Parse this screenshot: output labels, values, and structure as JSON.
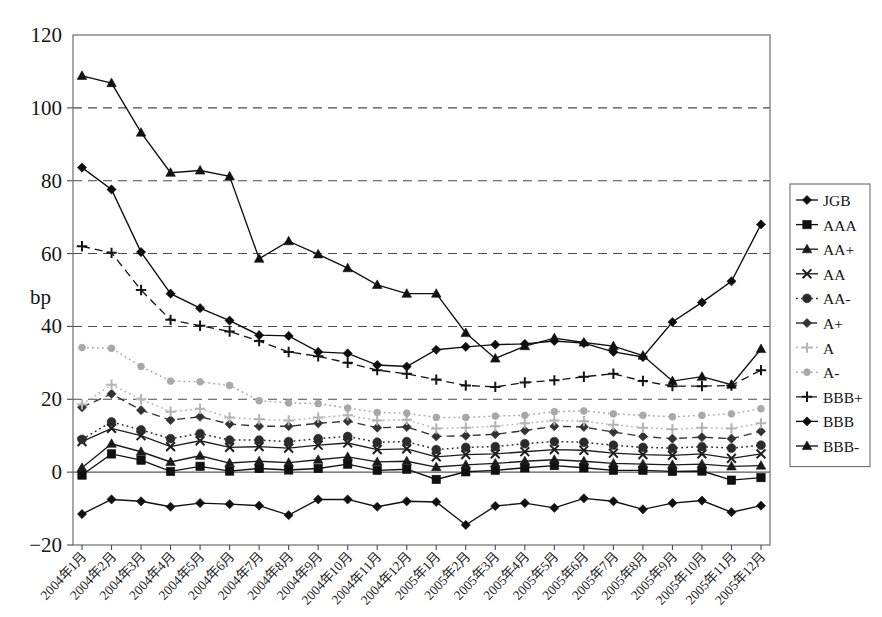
{
  "chart": {
    "title": "",
    "ylabel": "bp",
    "xlabel": "",
    "ylim": [
      -20,
      120
    ],
    "ytick_labels": [
      "120",
      "100",
      "80",
      "60",
      "40",
      "20",
      "0",
      "-20"
    ],
    "ytick_values": [
      120,
      100,
      80,
      60,
      40,
      20,
      0,
      -20
    ],
    "grid": "horizontal-dashed",
    "legend_position": "right-outside"
  },
  "chart_data": {
    "type": "line",
    "title": "",
    "xlabel": "",
    "ylabel": "bp",
    "ylim": [
      -20,
      120
    ],
    "yticks": [
      -20,
      0,
      20,
      40,
      60,
      80,
      100,
      120
    ],
    "grid": true,
    "legend": "right",
    "categories": [
      "2004年1月",
      "2004年2月",
      "2004年3月",
      "2004年4月",
      "2004年5月",
      "2004年6月",
      "2004年7月",
      "2004年8月",
      "2004年9月",
      "2004年10月",
      "2004年11月",
      "2004年12月",
      "2005年1月",
      "2005年2月",
      "2005年3月",
      "2005年4月",
      "2005年5月",
      "2005年6月",
      "2005年7月",
      "2005年8月",
      "2005年9月",
      "2005年10月",
      "2005年11月",
      "2005年12月"
    ],
    "series": [
      {
        "name": "JGB",
        "marker": "diamond",
        "linestyle": "solid",
        "color": "#101010",
        "values": [
          -11.5,
          -7.5,
          -8.0,
          -9.5,
          -8.5,
          -8.8,
          -9.2,
          -11.8,
          -7.5,
          -7.5,
          -9.5,
          -8.0,
          -8.2,
          -14.5,
          -9.3,
          -8.5,
          -9.8,
          -7.2,
          -8.0,
          -10.2,
          -8.5,
          -7.8,
          -11.0,
          -9.2
        ]
      },
      {
        "name": "AAA",
        "marker": "square",
        "linestyle": "solid",
        "color": "#101010",
        "values": [
          -0.8,
          5.0,
          3.3,
          0.2,
          1.6,
          0.3,
          1.0,
          0.6,
          1.0,
          2.2,
          0.5,
          0.8,
          -2.0,
          0.1,
          0.5,
          1.2,
          1.8,
          1.2,
          0.5,
          0.5,
          0.2,
          0.3,
          -2.2,
          -1.5
        ]
      },
      {
        "name": "AA+",
        "marker": "triangle",
        "linestyle": "solid",
        "color": "#1a1a1a",
        "values": [
          1.2,
          7.8,
          5.6,
          2.8,
          4.5,
          2.5,
          3.0,
          2.6,
          3.4,
          4.2,
          2.8,
          3.0,
          1.4,
          2.0,
          2.4,
          3.0,
          3.4,
          3.0,
          2.4,
          2.2,
          2.0,
          2.2,
          1.6,
          1.8
        ]
      },
      {
        "name": "AA",
        "marker": "x",
        "linestyle": "solid",
        "color": "#1d1d1d",
        "values": [
          8.4,
          12.0,
          10.0,
          7.0,
          8.6,
          6.8,
          7.0,
          6.6,
          7.4,
          8.0,
          6.2,
          6.4,
          4.2,
          4.8,
          5.0,
          5.6,
          6.2,
          6.0,
          5.2,
          4.8,
          4.6,
          5.0,
          3.8,
          5.0
        ]
      },
      {
        "name": "AA-",
        "marker": "circle",
        "linestyle": "dotted",
        "color": "#2b2b2b",
        "values": [
          9.0,
          13.8,
          11.6,
          9.2,
          10.6,
          8.8,
          8.8,
          8.4,
          9.2,
          9.8,
          8.2,
          8.4,
          6.2,
          6.8,
          7.0,
          7.8,
          8.4,
          8.2,
          7.4,
          6.8,
          6.6,
          7.0,
          6.6,
          7.4
        ]
      },
      {
        "name": "A+",
        "marker": "diamond",
        "linestyle": "dashed",
        "color": "#333333",
        "values": [
          17.8,
          21.5,
          17.0,
          14.3,
          15.2,
          13.2,
          12.6,
          12.6,
          13.4,
          14.0,
          12.2,
          12.4,
          9.8,
          10.0,
          10.4,
          11.4,
          12.6,
          12.4,
          11.0,
          9.8,
          9.2,
          9.6,
          9.2,
          11.2
        ]
      },
      {
        "name": "A",
        "marker": "plus",
        "linestyle": "dotted",
        "color": "#b4b4b4",
        "values": [
          18.6,
          24.0,
          20.0,
          16.6,
          17.4,
          15.0,
          14.5,
          14.2,
          15.0,
          15.6,
          14.2,
          14.4,
          12.0,
          12.2,
          12.6,
          13.4,
          14.2,
          14.0,
          13.0,
          12.2,
          11.8,
          12.2,
          12.0,
          13.4
        ]
      },
      {
        "name": "A-",
        "marker": "circle-small",
        "linestyle": "dotted",
        "color": "#a8a8a8",
        "values": [
          34.2,
          34.0,
          29.0,
          25.0,
          24.8,
          23.8,
          19.6,
          19.0,
          18.8,
          17.6,
          16.4,
          16.2,
          15.0,
          15.0,
          15.4,
          15.6,
          16.6,
          16.8,
          16.0,
          15.6,
          15.2,
          15.6,
          16.0,
          17.4
        ]
      },
      {
        "name": "BBB+",
        "marker": "plus",
        "linestyle": "dashed",
        "color": "#151515",
        "values": [
          62.0,
          60.2,
          50.0,
          41.8,
          40.2,
          38.6,
          36.0,
          33.0,
          31.8,
          30.0,
          28.0,
          27.0,
          25.4,
          23.8,
          23.4,
          24.6,
          25.2,
          26.2,
          27.0,
          25.0,
          23.6,
          23.6,
          23.8,
          28.0
        ]
      },
      {
        "name": "BBB",
        "marker": "diamond",
        "linestyle": "solid",
        "color": "#0d0d0d",
        "values": [
          83.6,
          77.6,
          60.4,
          49.0,
          45.0,
          41.6,
          37.6,
          37.4,
          33.0,
          32.6,
          29.4,
          29.0,
          33.6,
          34.4,
          35.0,
          35.2,
          36.0,
          35.4,
          33.0,
          31.6,
          41.2,
          46.6,
          52.4,
          68.0
        ]
      },
      {
        "name": "BBB-",
        "marker": "triangle",
        "linestyle": "solid",
        "color": "#111111",
        "values": [
          108.8,
          106.8,
          93.2,
          82.2,
          82.8,
          81.2,
          58.6,
          63.4,
          59.8,
          56.0,
          51.4,
          49.0,
          49.0,
          38.2,
          31.2,
          34.6,
          36.8,
          35.6,
          34.6,
          32.0,
          25.0,
          26.2,
          24.0,
          33.8
        ]
      }
    ]
  },
  "legend": {
    "items": [
      {
        "label": "JGB"
      },
      {
        "label": "AAA"
      },
      {
        "label": "AA+"
      },
      {
        "label": "AA"
      },
      {
        "label": "AA-"
      },
      {
        "label": "A+"
      },
      {
        "label": "A"
      },
      {
        "label": "A-"
      },
      {
        "label": "BBB+"
      },
      {
        "label": "BBB"
      },
      {
        "label": "BBB-"
      }
    ]
  }
}
